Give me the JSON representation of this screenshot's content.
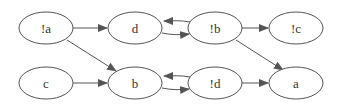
{
  "nodes": [
    {
      "id": "na",
      "label": "!a",
      "x": 46,
      "y": 28
    },
    {
      "id": "d",
      "label": "d",
      "x": 135,
      "y": 28
    },
    {
      "id": "nb",
      "label": "!b",
      "x": 215,
      "y": 28
    },
    {
      "id": "nc",
      "label": "!c",
      "x": 296,
      "y": 28
    },
    {
      "id": "c",
      "label": "c",
      "x": 46,
      "y": 83
    },
    {
      "id": "b",
      "label": "b",
      "x": 135,
      "y": 83
    },
    {
      "id": "nd",
      "label": "!d",
      "x": 215,
      "y": 83
    },
    {
      "id": "a",
      "label": "a",
      "x": 296,
      "y": 83
    }
  ],
  "edges": [
    {
      "from": "!a",
      "to": "d"
    },
    {
      "from": "!a",
      "to": "b"
    },
    {
      "from": "c",
      "to": "b"
    },
    {
      "from": "!b",
      "to": "d"
    },
    {
      "from": "d",
      "to": "!b"
    },
    {
      "from": "!b",
      "to": "!c"
    },
    {
      "from": "!b",
      "to": "a"
    },
    {
      "from": "!d",
      "to": "b"
    },
    {
      "from": "b",
      "to": "!d"
    },
    {
      "from": "!d",
      "to": "a"
    }
  ],
  "colors": {
    "stroke": "#555555",
    "text": "#333333"
  }
}
